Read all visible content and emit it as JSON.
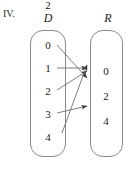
{
  "figure": {
    "label": "IV.",
    "type": "mapping-diagram"
  },
  "sets": {
    "domain": {
      "title": "D",
      "elements": [
        "0",
        "1",
        "2",
        "3",
        "4"
      ]
    },
    "range": {
      "title": "R",
      "elements": [
        "0",
        "2",
        "4"
      ]
    }
  },
  "mappings": [
    {
      "from": "0",
      "to": "2"
    },
    {
      "from": "1",
      "to": "0"
    },
    {
      "from": "2",
      "to": "0"
    },
    {
      "from": "3",
      "to": "4"
    },
    {
      "from": "4",
      "to": "0"
    }
  ],
  "colors": {
    "stroke": "#6f6f6f",
    "box_border": "#8a8a8a",
    "text": "#1a1a1a",
    "background": "#ffffff"
  }
}
